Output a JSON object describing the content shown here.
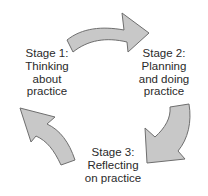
{
  "diagram": {
    "type": "cycle",
    "arrow_fill": "#c8c8c8",
    "arrow_stroke": "#6e6e6e",
    "stages": [
      {
        "id": "stage1",
        "lines": [
          "Stage 1:",
          "Thinking",
          "about",
          "practice"
        ]
      },
      {
        "id": "stage2",
        "lines": [
          "Stage 2:",
          "Planning",
          "and doing",
          "practice"
        ]
      },
      {
        "id": "stage3",
        "lines": [
          "Stage 3:",
          "Reflecting",
          "on practice"
        ]
      }
    ],
    "arrows": [
      {
        "from": "stage1",
        "to": "stage2"
      },
      {
        "from": "stage2",
        "to": "stage3"
      },
      {
        "from": "stage3",
        "to": "stage1"
      }
    ]
  }
}
